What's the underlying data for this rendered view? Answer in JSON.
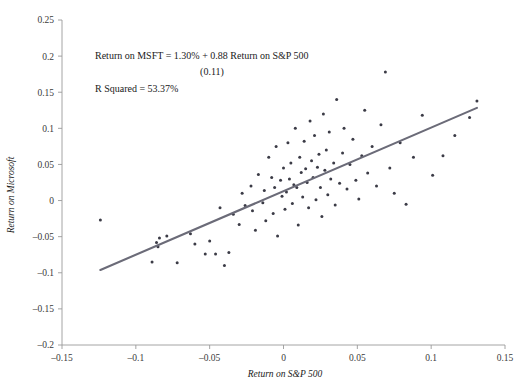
{
  "chart_data": {
    "type": "scatter",
    "title": "",
    "xlabel": "Return on S&P 500",
    "ylabel": "Return on Microsoft",
    "xlim": [
      -0.15,
      0.15
    ],
    "ylim": [
      -0.2,
      0.25
    ],
    "xticks": [
      "-0.15",
      "-0.1",
      "-0.05",
      "0",
      "0.05",
      "0.1",
      "0.15"
    ],
    "xtick_values": [
      -0.15,
      -0.1,
      -0.05,
      0,
      0.05,
      0.1,
      0.15
    ],
    "yticks": [
      "-0.2",
      "-0.15",
      "-0.1",
      "-0.05",
      "0",
      "0.05",
      "0.1",
      "0.15",
      "0.2",
      "0.25"
    ],
    "ytick_values": [
      -0.2,
      -0.15,
      -0.1,
      -0.05,
      0,
      0.05,
      0.1,
      0.15,
      0.2,
      0.25
    ],
    "grid": false,
    "legend": false,
    "point_color": "#3b3b46",
    "line_color": "#6b6b78",
    "axis_color": "#9a9a9a",
    "series": [
      {
        "name": "Monthly returns",
        "points": [
          [
            -0.124,
            -0.027
          ],
          [
            -0.089,
            -0.085
          ],
          [
            -0.086,
            -0.058
          ],
          [
            -0.085,
            -0.064
          ],
          [
            -0.084,
            -0.052
          ],
          [
            -0.079,
            -0.049
          ],
          [
            -0.072,
            -0.086
          ],
          [
            -0.063,
            -0.046
          ],
          [
            -0.06,
            -0.06
          ],
          [
            -0.053,
            -0.074
          ],
          [
            -0.05,
            -0.056
          ],
          [
            -0.046,
            -0.074
          ],
          [
            -0.043,
            -0.01
          ],
          [
            -0.04,
            -0.09
          ],
          [
            -0.037,
            -0.072
          ],
          [
            -0.034,
            -0.019
          ],
          [
            -0.03,
            -0.033
          ],
          [
            -0.028,
            0.01
          ],
          [
            -0.026,
            -0.007
          ],
          [
            -0.022,
            0.02
          ],
          [
            -0.021,
            -0.014
          ],
          [
            -0.019,
            -0.041
          ],
          [
            -0.017,
            0.036
          ],
          [
            -0.014,
            -0.003
          ],
          [
            -0.013,
            0.014
          ],
          [
            -0.012,
            -0.028
          ],
          [
            -0.01,
            0.06
          ],
          [
            -0.008,
            0.032
          ],
          [
            -0.007,
            -0.018
          ],
          [
            -0.006,
            0.018
          ],
          [
            -0.005,
            0.075
          ],
          [
            -0.004,
            -0.049
          ],
          [
            -0.002,
            0.028
          ],
          [
            -0.001,
            0.006
          ],
          [
            0.0,
            0.045
          ],
          [
            0.001,
            -0.012
          ],
          [
            0.002,
            0.012
          ],
          [
            0.003,
            0.08
          ],
          [
            0.004,
            0.03
          ],
          [
            0.005,
            0.052
          ],
          [
            0.006,
            -0.004
          ],
          [
            0.007,
            0.022
          ],
          [
            0.008,
            0.1
          ],
          [
            0.009,
            0.018
          ],
          [
            0.01,
            -0.034
          ],
          [
            0.011,
            0.06
          ],
          [
            0.012,
            0.039
          ],
          [
            0.013,
            0.005
          ],
          [
            0.014,
            0.082
          ],
          [
            0.015,
            0.044
          ],
          [
            0.016,
            0.025
          ],
          [
            0.017,
            -0.01
          ],
          [
            0.018,
            0.11
          ],
          [
            0.019,
            0.055
          ],
          [
            0.02,
            0.032
          ],
          [
            0.021,
            0.09
          ],
          [
            0.022,
            0.001
          ],
          [
            0.023,
            0.046
          ],
          [
            0.024,
            0.064
          ],
          [
            0.025,
            0.018
          ],
          [
            0.026,
            -0.022
          ],
          [
            0.027,
            0.12
          ],
          [
            0.028,
            0.042
          ],
          [
            0.029,
            0.07
          ],
          [
            0.03,
            0.008
          ],
          [
            0.031,
            0.095
          ],
          [
            0.032,
            0.03
          ],
          [
            0.034,
            0.052
          ],
          [
            0.035,
            -0.006
          ],
          [
            0.036,
            0.14
          ],
          [
            0.038,
            0.024
          ],
          [
            0.04,
            0.066
          ],
          [
            0.041,
            0.1
          ],
          [
            0.043,
            0.016
          ],
          [
            0.045,
            0.05
          ],
          [
            0.047,
            0.085
          ],
          [
            0.049,
            0.028
          ],
          [
            0.051,
            0.002
          ],
          [
            0.053,
            0.062
          ],
          [
            0.055,
            0.125
          ],
          [
            0.057,
            0.038
          ],
          [
            0.06,
            0.075
          ],
          [
            0.063,
            0.02
          ],
          [
            0.066,
            0.105
          ],
          [
            0.069,
            0.178
          ],
          [
            0.072,
            0.045
          ],
          [
            0.075,
            0.01
          ],
          [
            0.079,
            0.08
          ],
          [
            0.083,
            -0.005
          ],
          [
            0.088,
            0.06
          ],
          [
            0.094,
            0.118
          ],
          [
            0.101,
            0.035
          ],
          [
            0.108,
            0.062
          ],
          [
            0.116,
            0.09
          ],
          [
            0.126,
            0.115
          ],
          [
            0.131,
            0.138
          ]
        ]
      }
    ],
    "regression": {
      "intercept": 0.013,
      "slope": 0.88,
      "x_start": -0.124,
      "x_end": 0.131
    },
    "annotations": {
      "equation": "Return on MSFT = 1.30% + 0.88 Return on S&P 500",
      "standard_error": "(0.11)",
      "r_squared": "R Squared = 53.37%"
    }
  }
}
